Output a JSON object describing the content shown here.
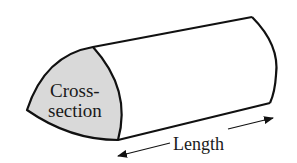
{
  "diagram": {
    "type": "prism-cross-section",
    "labels": {
      "cross_section_line1": "Cross-",
      "cross_section_line2": "section",
      "length": "Length"
    },
    "colors": {
      "stroke": "#111111",
      "cross_section_fill": "#d9d9d9",
      "background": "#ffffff",
      "text": "#1a1a1a"
    },
    "arrow": {
      "direction": "bidirectional",
      "meaning": "length"
    }
  }
}
